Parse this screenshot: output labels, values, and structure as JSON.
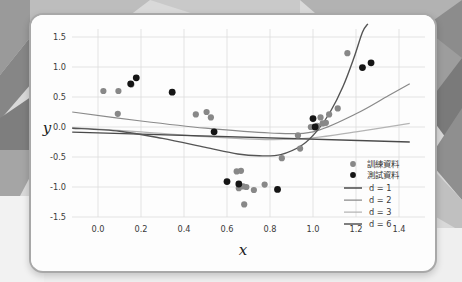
{
  "card": {
    "background_color": "#fdfdfd",
    "border_color": "#a8a8a8"
  },
  "background": {
    "base_color": "#d2d2d2",
    "shade_dark": "#8e8e8e",
    "shade_mid": "#b0b0b0",
    "shade_light": "#e6e6e6"
  },
  "chart_data": {
    "type": "scatter",
    "title": "",
    "xlabel": "x",
    "ylabel": "y",
    "xlim": [
      -0.12,
      1.45
    ],
    "ylim": [
      -1.72,
      1.72
    ],
    "xticks": [
      "0.0",
      "0.2",
      "0.4",
      "0.6",
      "0.8",
      "1.0",
      "1.2",
      "1.4"
    ],
    "xtick_values": [
      0.0,
      0.2,
      0.4,
      0.6,
      0.8,
      1.0,
      1.2,
      1.4
    ],
    "yticks": [
      "1.5",
      "1.0",
      "0.5",
      "0.0",
      "-0.5",
      "-1.0",
      "-1.5"
    ],
    "ytick_values": [
      1.5,
      1.0,
      0.5,
      0.0,
      -0.5,
      -1.0,
      -1.5
    ],
    "grid": true,
    "legend_position": "lower right",
    "series": [
      {
        "name": "訓練資料",
        "type": "scatter",
        "marker": "circle",
        "color": "#888888",
        "points": [
          [
            0.025,
            0.6
          ],
          [
            0.095,
            0.6
          ],
          [
            0.155,
            0.71
          ],
          [
            0.092,
            0.22
          ],
          [
            0.455,
            0.21
          ],
          [
            0.505,
            0.25
          ],
          [
            0.525,
            0.16
          ],
          [
            0.645,
            -0.74
          ],
          [
            0.665,
            -0.73
          ],
          [
            0.655,
            -1.02
          ],
          [
            0.675,
            -0.99
          ],
          [
            0.69,
            -1.0
          ],
          [
            0.725,
            -1.05
          ],
          [
            0.68,
            -1.29
          ],
          [
            0.775,
            -0.96
          ],
          [
            0.855,
            -0.52
          ],
          [
            0.94,
            -0.36
          ],
          [
            0.93,
            -0.14
          ],
          [
            0.99,
            0.0
          ],
          [
            1.005,
            0.0
          ],
          [
            1.02,
            0.02
          ],
          [
            1.045,
            0.06
          ],
          [
            1.06,
            0.07
          ],
          [
            1.035,
            0.16
          ],
          [
            1.075,
            0.21
          ],
          [
            1.115,
            0.31
          ],
          [
            1.16,
            1.23
          ]
        ]
      },
      {
        "name": "測試資料",
        "type": "scatter",
        "marker": "circle",
        "color": "#151515",
        "points": [
          [
            0.152,
            0.72
          ],
          [
            0.178,
            0.82
          ],
          [
            0.345,
            0.58
          ],
          [
            0.54,
            -0.08
          ],
          [
            0.6,
            -0.91
          ],
          [
            0.655,
            -0.95
          ],
          [
            0.835,
            -1.04
          ],
          [
            1.0,
            0.14
          ],
          [
            1.01,
            0.0
          ],
          [
            1.23,
            0.99
          ],
          [
            1.27,
            1.07
          ]
        ]
      },
      {
        "name": "d = 1",
        "type": "line",
        "color": "#4a4a4a",
        "description": "linear fit, gently decreasing",
        "points": [
          [
            -0.12,
            -0.085
          ],
          [
            1.45,
            -0.25
          ]
        ]
      },
      {
        "name": "d = 2",
        "type": "line",
        "color": "#8a8a8a",
        "description": "quadratic fit, rising to the right",
        "points": [
          [
            -0.12,
            0.25
          ],
          [
            0.2,
            0.1
          ],
          [
            0.5,
            -0.02
          ],
          [
            0.8,
            -0.1
          ],
          [
            1.0,
            -0.08
          ],
          [
            1.2,
            0.22
          ],
          [
            1.35,
            0.52
          ],
          [
            1.45,
            0.72
          ]
        ]
      },
      {
        "name": "d = 3",
        "type": "line",
        "color": "#b4b4b4",
        "description": "cubic fit, shallow dip then flattening",
        "points": [
          [
            -0.12,
            -0.01
          ],
          [
            0.2,
            -0.08
          ],
          [
            0.5,
            -0.16
          ],
          [
            0.8,
            -0.21
          ],
          [
            1.0,
            -0.18
          ],
          [
            1.2,
            -0.08
          ],
          [
            1.45,
            0.06
          ]
        ]
      },
      {
        "name": "d = 6",
        "type": "line",
        "color": "#555555",
        "description": "degree-6 fit, deep trough near x=0.75 then steep rise",
        "points": [
          [
            -0.12,
            -0.02
          ],
          [
            0.1,
            -0.07
          ],
          [
            0.3,
            -0.19
          ],
          [
            0.5,
            -0.34
          ],
          [
            0.65,
            -0.45
          ],
          [
            0.75,
            -0.48
          ],
          [
            0.85,
            -0.46
          ],
          [
            0.95,
            -0.3
          ],
          [
            1.02,
            -0.06
          ],
          [
            1.08,
            0.25
          ],
          [
            1.14,
            0.68
          ],
          [
            1.19,
            1.15
          ],
          [
            1.23,
            1.58
          ],
          [
            1.255,
            1.72
          ]
        ]
      }
    ]
  },
  "legend": {
    "entries": [
      {
        "label": "訓練資料",
        "kind": "marker",
        "color": "#888888"
      },
      {
        "label": "測試資料",
        "kind": "marker",
        "color": "#151515"
      },
      {
        "label": "d = 1",
        "kind": "line",
        "color": "#4a4a4a"
      },
      {
        "label": "d = 2",
        "kind": "line",
        "color": "#8a8a8a"
      },
      {
        "label": "d = 3",
        "kind": "line",
        "color": "#b4b4b4"
      },
      {
        "label": "d = 6",
        "kind": "line",
        "color": "#555555"
      }
    ]
  }
}
